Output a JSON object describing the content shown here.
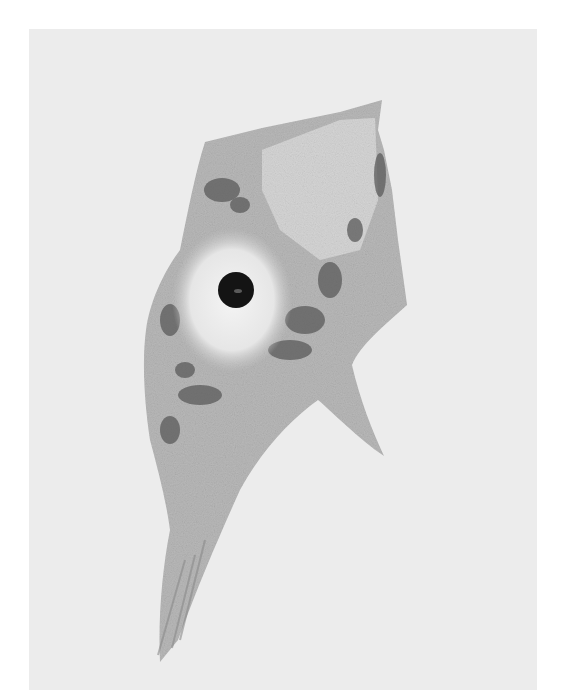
{
  "figure": {
    "colors": {
      "background": "#ffffff",
      "plate": "#ececec",
      "cytoplasm": "#b9b9b9",
      "cytoplasm_light": "#d6d6d6",
      "granules": "#5a5a5a",
      "nucleus": "#e8e8e8",
      "nucleolus": "#141414",
      "axon": "#a9a9a9"
    },
    "parts": {
      "nucleolus": {
        "cx": 236,
        "cy": 290,
        "r": 18
      },
      "nucleus": {
        "cx": 232,
        "cy": 300,
        "rx": 60,
        "ry": 72
      }
    }
  }
}
